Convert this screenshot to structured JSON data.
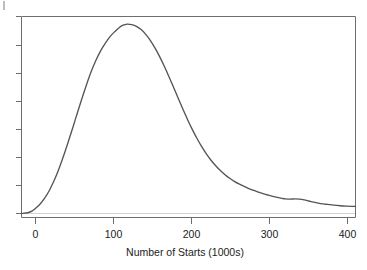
{
  "chart_data": {
    "type": "line",
    "title": "",
    "subtitle": "",
    "xlabel": "Number of Starts (1000s)",
    "ylabel": "",
    "xlim": [
      -18,
      412
    ],
    "ylim": [
      0,
      1.04
    ],
    "grid": false,
    "legend": null,
    "xticks": [
      0,
      100,
      200,
      300,
      400
    ],
    "xtick_labels": [
      "0",
      "100",
      "200",
      "300",
      "400"
    ],
    "yticks": [
      0.0,
      0.145,
      0.29,
      0.435,
      0.58,
      0.725,
      0.87,
      1.0
    ],
    "ytick_labels": [
      "",
      "",
      "",
      "",
      "",
      "",
      "",
      ""
    ],
    "series": [
      {
        "name": "density",
        "x": [
          -18,
          -10,
          -4,
          0,
          6,
          12,
          18,
          24,
          30,
          36,
          42,
          48,
          54,
          60,
          66,
          72,
          78,
          84,
          90,
          96,
          102,
          108,
          112,
          118,
          124,
          130,
          136,
          142,
          148,
          154,
          160,
          166,
          172,
          178,
          184,
          190,
          196,
          202,
          208,
          214,
          220,
          226,
          232,
          238,
          244,
          250,
          256,
          262,
          268,
          274,
          280,
          286,
          292,
          298,
          304,
          310,
          316,
          322,
          328,
          334,
          340,
          346,
          352,
          358,
          364,
          370,
          376,
          384,
          392,
          400,
          408,
          412
        ],
        "y": [
          0.0,
          0.004,
          0.014,
          0.027,
          0.05,
          0.082,
          0.123,
          0.174,
          0.234,
          0.302,
          0.376,
          0.453,
          0.532,
          0.61,
          0.684,
          0.752,
          0.81,
          0.86,
          0.9,
          0.934,
          0.96,
          0.982,
          0.993,
          1.0,
          0.997,
          0.988,
          0.971,
          0.946,
          0.913,
          0.873,
          0.827,
          0.776,
          0.721,
          0.664,
          0.606,
          0.549,
          0.494,
          0.443,
          0.396,
          0.353,
          0.315,
          0.281,
          0.252,
          0.227,
          0.205,
          0.186,
          0.17,
          0.156,
          0.144,
          0.133,
          0.123,
          0.114,
          0.106,
          0.099,
          0.092,
          0.086,
          0.081,
          0.077,
          0.076,
          0.077,
          0.076,
          0.072,
          0.066,
          0.06,
          0.055,
          0.051,
          0.048,
          0.044,
          0.041,
          0.039,
          0.038,
          0.038
        ]
      }
    ],
    "annotations": [],
    "colors": {
      "curve": "#555555",
      "frame": "#6e6e6e",
      "baseline": "#d2d2d2",
      "text": "#1c1c1c",
      "background": "#ffffff"
    }
  },
  "figure": {
    "axis_title": "Number of Starts (1000s)",
    "tick_labels": {
      "x0": "0",
      "x1": "100",
      "x2": "200",
      "x3": "300",
      "x4": "400"
    }
  }
}
